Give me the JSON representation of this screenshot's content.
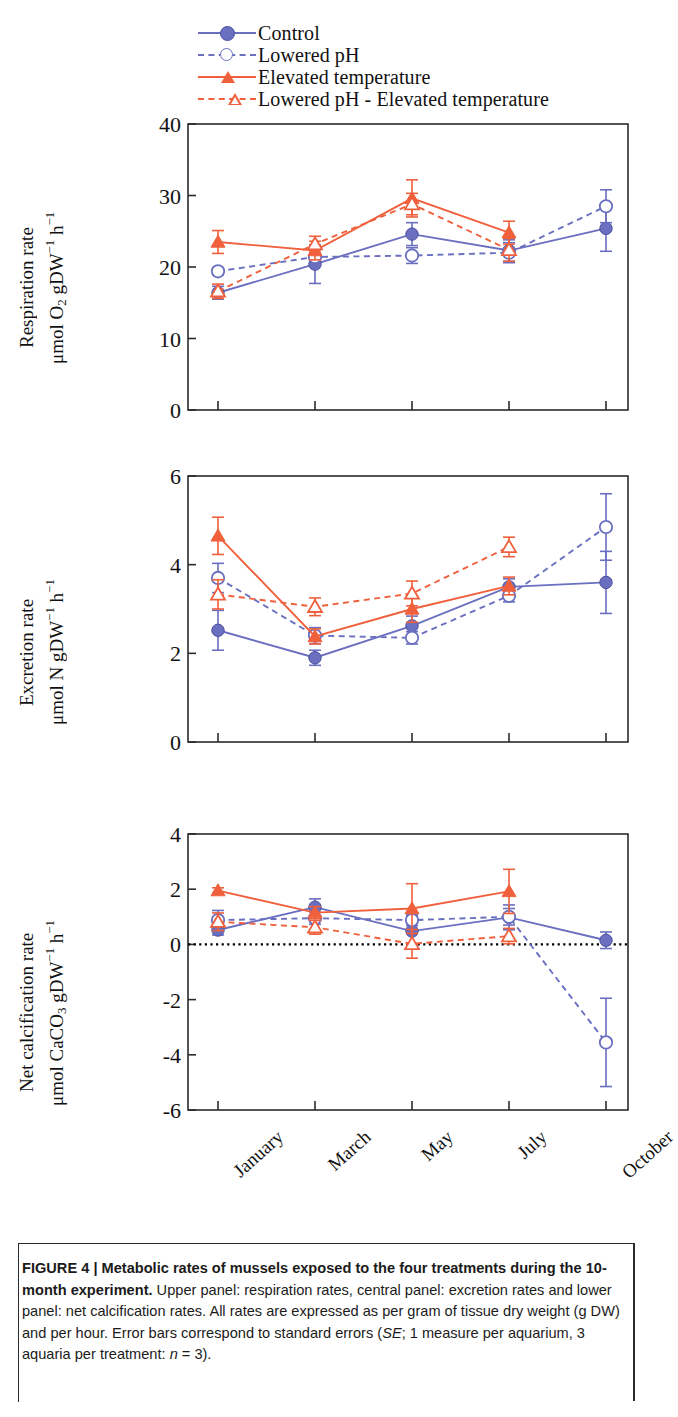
{
  "figure": {
    "number": "FIGURE 4",
    "separator": "|",
    "title": "Metabolic rates of mussels exposed to the four treatments during the 10-month experiment.",
    "caption_rest": " Upper panel: respiration rates, central panel: excretion rates and lower panel: net calcification rates. All rates are expressed as per gram of tissue dry weight (g DW) and per hour. Error bars correspond to standard errors (",
    "caption_se": "SE",
    "caption_tail": "; 1 measure per aquarium, 3 aquaria per treatment: ",
    "caption_n": "n",
    "caption_end": " = 3)."
  },
  "legend": {
    "position": "top",
    "items": [
      {
        "label": "Control",
        "color": "#6a6fc0",
        "marker": "filled-circle",
        "line": "solid"
      },
      {
        "label": "Lowered pH",
        "color": "#6a6fc0",
        "marker": "open-circle",
        "line": "dashed"
      },
      {
        "label": "Elevated temperature",
        "color": "#f0603c",
        "marker": "filled-triangle",
        "line": "solid"
      },
      {
        "label": "Lowered pH - Elevated temperature",
        "color": "#f0603c",
        "marker": "open-triangle",
        "line": "dashed"
      }
    ]
  },
  "colors": {
    "blue": "#6a6fc0",
    "orange": "#f0603c",
    "axis": "#2b2b2b",
    "zero_line": "#000000"
  },
  "axis": {
    "x_categories": [
      "January",
      "March",
      "May",
      "July",
      "October"
    ],
    "panel1_ticks": [
      "0",
      "10",
      "20",
      "30",
      "40"
    ],
    "panel2_ticks": [
      "0",
      "2",
      "4",
      "6"
    ],
    "panel3_ticks": [
      "-6",
      "-4",
      "-2",
      "0",
      "2",
      "4"
    ]
  },
  "chart_data": [
    {
      "type": "line",
      "panel": "upper",
      "title": "Respiration rate",
      "ylabel_line1": "Respiration rate",
      "ylabel_line2": "μmol O2 gDW-1 h-1",
      "xlabel": "",
      "categories": [
        "January",
        "March",
        "May",
        "July",
        "October"
      ],
      "ylim": [
        0,
        40
      ],
      "yticks": [
        0,
        10,
        20,
        30,
        40
      ],
      "grid": false,
      "series": [
        {
          "name": "Control",
          "values": [
            16.4,
            20.4,
            24.6,
            22.3,
            25.4
          ],
          "errors": [
            0.9,
            2.7,
            1.6,
            1.5,
            3.2
          ]
        },
        {
          "name": "Lowered pH",
          "values": [
            19.4,
            21.4,
            21.6,
            22.0,
            28.5
          ],
          "errors": [
            0.5,
            1.0,
            1.1,
            1.4,
            2.3
          ]
        },
        {
          "name": "Elevated temperature",
          "values": [
            23.5,
            22.3,
            29.6,
            24.8,
            null
          ],
          "errors": [
            1.6,
            1.3,
            2.6,
            1.6,
            null
          ]
        },
        {
          "name": "Lowered pH - Elevated temperature",
          "values": [
            16.6,
            23.2,
            28.8,
            22.4,
            null
          ],
          "errors": [
            1.0,
            1.1,
            1.5,
            1.6,
            null
          ]
        }
      ]
    },
    {
      "type": "line",
      "panel": "central",
      "title": "Excretion rate",
      "ylabel_line1": "Excretion rate",
      "ylabel_line2": "μmol N gDW-1 h-1",
      "xlabel": "",
      "categories": [
        "January",
        "March",
        "May",
        "July",
        "October"
      ],
      "ylim": [
        0,
        6
      ],
      "yticks": [
        0,
        2,
        4,
        6
      ],
      "grid": false,
      "series": [
        {
          "name": "Control",
          "values": [
            2.52,
            1.9,
            2.62,
            3.5,
            3.6
          ],
          "errors": [
            0.45,
            0.17,
            0.22,
            0.18,
            0.7
          ]
        },
        {
          "name": "Lowered pH",
          "values": [
            3.7,
            2.4,
            2.35,
            3.3,
            4.85
          ],
          "errors": [
            0.33,
            0.18,
            0.14,
            0.14,
            0.75
          ]
        },
        {
          "name": "Elevated temperature",
          "values": [
            4.65,
            2.38,
            3.0,
            3.52,
            null
          ],
          "errors": [
            0.42,
            0.17,
            0.3,
            0.2,
            null
          ]
        },
        {
          "name": "Lowered pH - Elevated temperature",
          "values": [
            3.33,
            3.05,
            3.35,
            4.4,
            null
          ],
          "errors": [
            0.33,
            0.2,
            0.28,
            0.22,
            null
          ]
        }
      ]
    },
    {
      "type": "line",
      "panel": "lower",
      "title": "Net calcification rate",
      "ylabel_line1": "Net calcification rate",
      "ylabel_line2": "μmol CaCO3 gDW-1 h-1",
      "xlabel": "",
      "categories": [
        "January",
        "March",
        "May",
        "July",
        "October"
      ],
      "ylim": [
        -6,
        4
      ],
      "yticks": [
        -6,
        -4,
        -2,
        0,
        2,
        4
      ],
      "zero_line": 0,
      "grid": false,
      "series": [
        {
          "name": "Control",
          "values": [
            0.52,
            1.35,
            0.48,
            0.98,
            0.15
          ],
          "errors": [
            0.18,
            0.3,
            0.55,
            0.45,
            0.3
          ]
        },
        {
          "name": "Lowered pH",
          "values": [
            0.88,
            0.95,
            0.88,
            1.0,
            -3.55
          ],
          "errors": [
            0.35,
            0.22,
            0.2,
            0.3,
            1.6
          ]
        },
        {
          "name": "Elevated temperature",
          "values": [
            1.95,
            1.15,
            1.3,
            1.92,
            null
          ],
          "errors": [
            0.1,
            0.22,
            0.9,
            0.8,
            null
          ]
        },
        {
          "name": "Lowered pH - Elevated temperature",
          "values": [
            0.82,
            0.62,
            0.02,
            0.3,
            null
          ],
          "errors": [
            0.32,
            0.25,
            0.52,
            0.28,
            null
          ]
        }
      ]
    }
  ]
}
